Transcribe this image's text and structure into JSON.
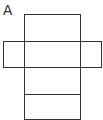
{
  "diagram": {
    "label": "A",
    "stroke_color": "#333333",
    "faces": [
      {
        "name": "top-face",
        "x": 24,
        "y": 14,
        "w": 56,
        "h": 27
      },
      {
        "name": "left-face",
        "x": 3,
        "y": 41,
        "w": 21,
        "h": 26
      },
      {
        "name": "front-face",
        "x": 24,
        "y": 41,
        "w": 56,
        "h": 26
      },
      {
        "name": "right-face",
        "x": 80,
        "y": 41,
        "w": 21,
        "h": 26
      },
      {
        "name": "bottom-face",
        "x": 24,
        "y": 67,
        "w": 56,
        "h": 27
      },
      {
        "name": "back-face",
        "x": 24,
        "y": 94,
        "w": 56,
        "h": 25
      }
    ]
  }
}
